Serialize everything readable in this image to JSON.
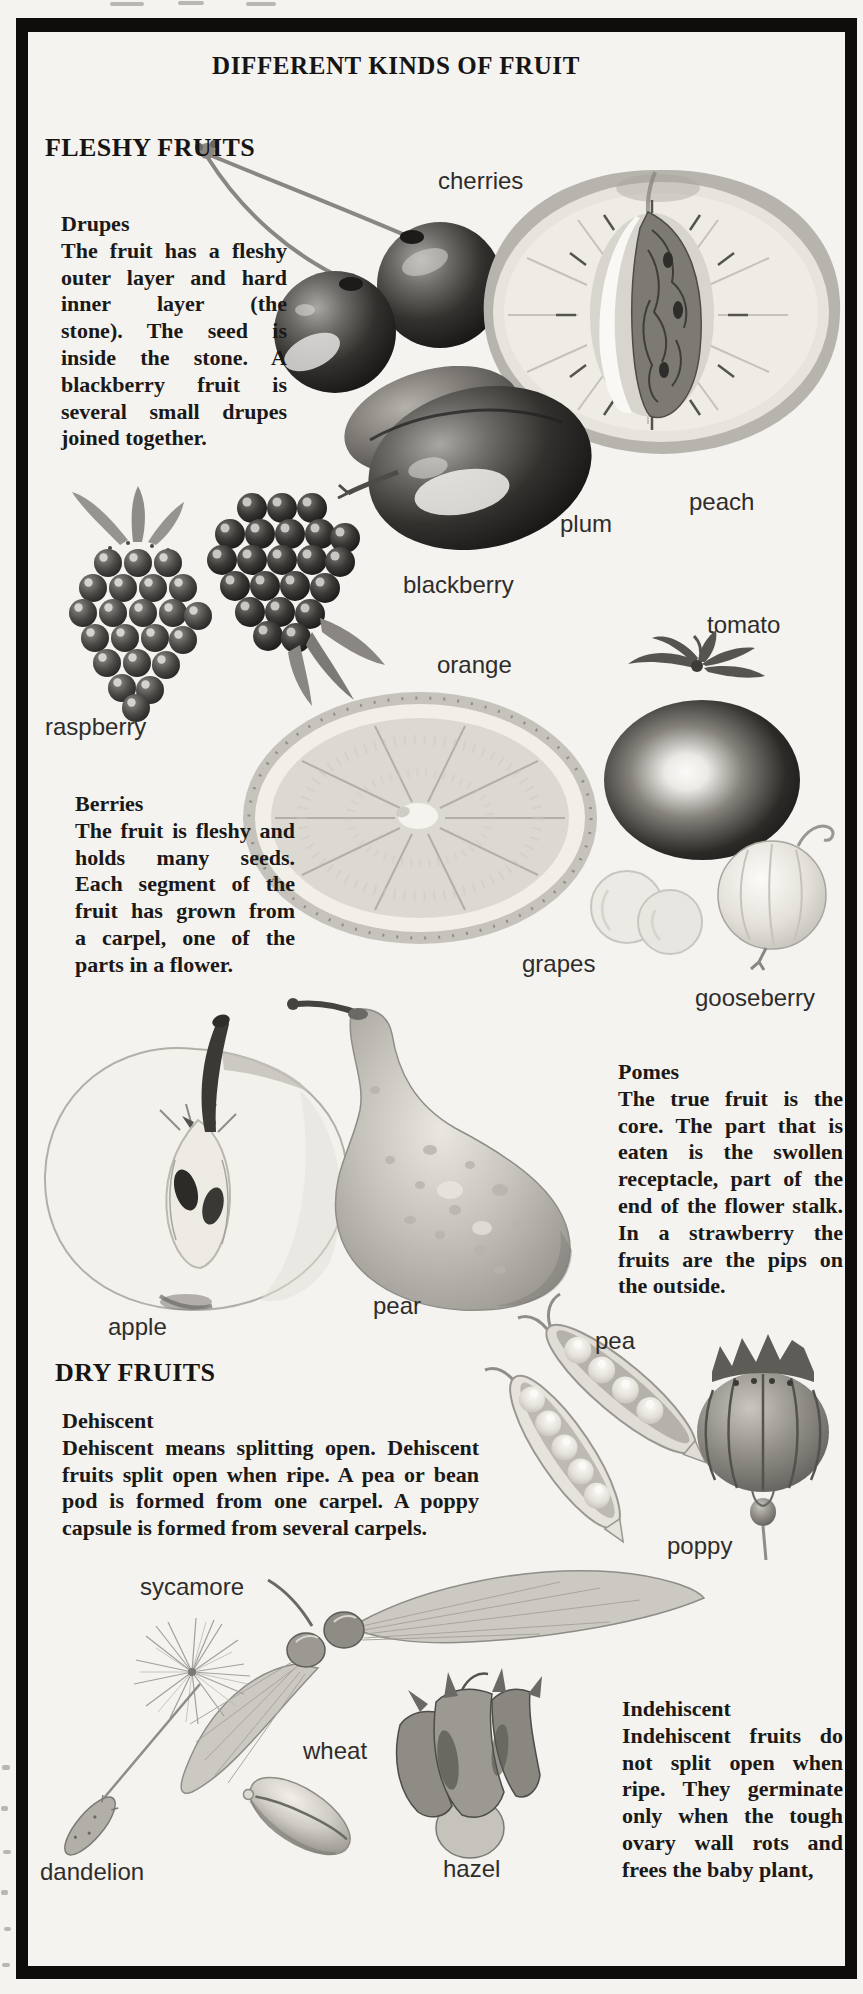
{
  "colors": {
    "paper": "#f5f3ef",
    "ink": "#1a1918",
    "label_ink": "#2e2d2b",
    "frame": "#0e0d0c"
  },
  "title": "DIFFERENT KINDS OF FRUIT",
  "sections": {
    "fleshy": {
      "heading": "FLESHY FRUITS"
    },
    "dry": {
      "heading": "DRY FRUITS"
    }
  },
  "blocks": {
    "drupes": {
      "heading": "Drupes",
      "lines": [
        "The fruit has a fleshy",
        "outer layer and hard",
        "inner layer (the",
        "stone). The seed is",
        "inside the stone. A",
        "blackberry fruit is",
        "several small drupes",
        "joined together."
      ],
      "text": "The fruit has a fleshy outer layer and hard inner layer (the stone). The seed is inside the stone. A blackberry fruit is several small drupes joined together."
    },
    "berries": {
      "heading": "Berries",
      "lines": [
        "The fruit is fleshy and",
        "holds many seeds.",
        "Each segment of the",
        "fruit has grown from",
        "a carpel, one of the",
        "parts in a flower."
      ],
      "text": "The fruit is fleshy and holds many seeds. Each segment of the fruit has grown from a carpel, one of the parts in a flower."
    },
    "pomes": {
      "heading": "Pomes",
      "lines": [
        "The true fruit is the",
        "core. The part that is",
        "eaten is the swollen",
        "receptacle, part of the",
        "end of the flower stalk.",
        "In a strawberry the",
        "fruits are the pips on",
        "the outside."
      ],
      "text": "The true fruit is the core. The part that is eaten is the swollen receptacle, part of the end of the flower stalk. In a strawberry the fruits are the pips on the outside."
    },
    "dehiscent": {
      "heading": "Dehiscent",
      "lines": [
        "Dehiscent means splitting open. Dehiscent",
        "fruits split open when ripe. A pea or bean",
        "pod is formed from one carpel. A poppy",
        "capsule is formed from several carpels."
      ],
      "text": "Dehiscent means splitting open. Dehiscent fruits split open when ripe. A pea or bean pod is formed from one carpel. A poppy capsule is formed from several carpels."
    },
    "indehiscent": {
      "heading": "Indehiscent",
      "lines": [
        "Indehiscent fruits do",
        "not split open when",
        "ripe. They germinate",
        "only when the tough",
        "ovary wall rots and",
        "frees the baby plant,"
      ],
      "text": "Indehiscent fruits do not split open when ripe. They germinate only when the tough ovary wall rots and frees the baby plant,"
    }
  },
  "labels": {
    "cherries": "cherries",
    "peach": "peach",
    "plum": "plum",
    "blackberry": "blackberry",
    "raspberry": "raspberry",
    "orange": "orange",
    "tomato": "tomato",
    "grapes": "grapes",
    "gooseberry": "gooseberry",
    "apple": "apple",
    "pear": "pear",
    "pea": "pea",
    "poppy": "poppy",
    "sycamore": "sycamore",
    "wheat": "wheat",
    "dandelion": "dandelion",
    "hazel": "hazel"
  },
  "illustrations": [
    "cherries",
    "peach",
    "plum",
    "raspberry",
    "blackberry",
    "orange",
    "tomato",
    "grapes",
    "gooseberry",
    "apple",
    "pear",
    "pea-pods",
    "poppy",
    "sycamore",
    "dandelion",
    "wheat",
    "hazel"
  ]
}
